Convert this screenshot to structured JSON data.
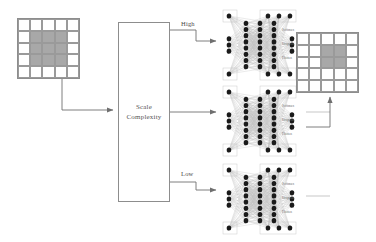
{
  "diagram": {
    "colors": {
      "stroke": "#8d8d8d",
      "grid_line": "#9a9a9a",
      "shaded_cell": "#a8a8a8",
      "node": "#1a1a1a",
      "edge": "#b5b5b5",
      "text": "#4a4a4a"
    }
  },
  "input_grid": {
    "name": "input-feature-map",
    "rows": 5,
    "cols": 5,
    "cells": [
      [
        0,
        0,
        0,
        0,
        0
      ],
      [
        0,
        1,
        1,
        1,
        0
      ],
      [
        0,
        1,
        1,
        1,
        0
      ],
      [
        0,
        1,
        1,
        1,
        0
      ],
      [
        0,
        0,
        0,
        0,
        0
      ]
    ]
  },
  "output_grid": {
    "name": "output-feature-map",
    "rows": 5,
    "cols": 5,
    "cells": [
      [
        0,
        0,
        0,
        0,
        0
      ],
      [
        0,
        0,
        1,
        1,
        0
      ],
      [
        0,
        0,
        1,
        1,
        0
      ],
      [
        0,
        0,
        0,
        0,
        0
      ],
      [
        0,
        0,
        0,
        0,
        0
      ]
    ]
  },
  "scale_box": {
    "line1": "Scale",
    "line2": "Complexity"
  },
  "branches": [
    {
      "label": "High",
      "id": "high"
    },
    {
      "label": "",
      "id": "medium"
    },
    {
      "label": "Low",
      "id": "low"
    }
  ],
  "networks": [
    {
      "id": "high",
      "layer_labels": [
        "Softmax",
        "Dropout",
        "Flatten"
      ],
      "node_counts": [
        3,
        8,
        8,
        8,
        3
      ],
      "top_band_nodes": 4,
      "bottom_band_nodes": 4
    },
    {
      "id": "medium",
      "layer_labels": [
        "Softmax",
        "Dropout",
        "Flatten"
      ],
      "node_counts": [
        3,
        8,
        8,
        8,
        3
      ],
      "top_band_nodes": 4,
      "bottom_band_nodes": 4
    },
    {
      "id": "low",
      "layer_labels": [
        "Softmax",
        "Dropout",
        "Flatten"
      ],
      "node_counts": [
        3,
        8,
        8,
        8,
        3
      ],
      "top_band_nodes": 4,
      "bottom_band_nodes": 4
    }
  ],
  "connectors": {
    "input_to_scale": "arrow-right",
    "scale_to_high": "arrow-right",
    "scale_to_low": "arrow-right",
    "network_to_output": "arrow-up"
  }
}
